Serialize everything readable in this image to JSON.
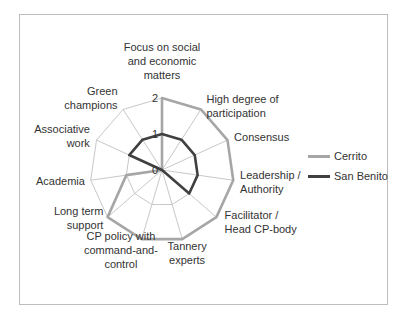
{
  "caption": "Mapping of the institutional work in the cases",
  "chart_data": {
    "type": "radar",
    "title": "",
    "categories": [
      "Focus on social and economic matters",
      "High degree of participation",
      "Consensus",
      "Leadership / Authority",
      "Facilitator / Head CP-body",
      "Tannery experts",
      "CP policy with command-and-control",
      "Long term support",
      "Academia",
      "Associative work",
      "Green champions"
    ],
    "series": [
      {
        "name": "Cerrito",
        "color": "#a6a6a6",
        "values": [
          2,
          2,
          2,
          2,
          2,
          2,
          2,
          2,
          1,
          0,
          0
        ]
      },
      {
        "name": "San Benito",
        "color": "#404040",
        "values": [
          1,
          1,
          1,
          1,
          1,
          0,
          0,
          0,
          0,
          1,
          1
        ]
      }
    ],
    "radial_ticks": [
      "0",
      "1",
      "2"
    ],
    "rlim": [
      0,
      2
    ],
    "grid": true,
    "legend_position": "right"
  },
  "legend": {
    "items": [
      {
        "label": "Cerrito",
        "color": "#a6a6a6"
      },
      {
        "label": "San Benito",
        "color": "#404040"
      }
    ]
  },
  "axis_labels": [
    [
      "Focus on social",
      "and economic",
      "matters"
    ],
    [
      "High degree of",
      "participation"
    ],
    [
      "Consensus"
    ],
    [
      "Leadership /",
      "Authority"
    ],
    [
      "Facilitator /",
      "Head CP-body"
    ],
    [
      "Tannery",
      "experts"
    ],
    [
      "CP policy with",
      "command-and-",
      "control"
    ],
    [
      "Long term",
      "support"
    ],
    [
      "Academia"
    ],
    [
      "Associative",
      "work"
    ],
    [
      "Green",
      "champions"
    ]
  ]
}
